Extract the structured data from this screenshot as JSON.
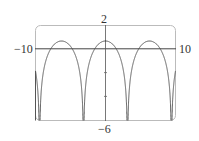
{
  "chart_data": {
    "type": "line",
    "title": "",
    "xlabel": "",
    "ylabel": "",
    "xlim": [
      -10,
      10
    ],
    "ylim": [
      -6,
      2
    ],
    "grid": false,
    "tick_labels": {
      "x_min": "−10",
      "x_max": "10",
      "y_max": "2",
      "y_min": "−6"
    },
    "series": [
      {
        "name": "y = ln(1 + cos x)",
        "description": "periodic arches, period 2π, peak ≈0.69 at x = 0, ±2π; vertical asymptotes at x = ±π, ±3π",
        "x": [
          -10,
          -9.42,
          -8,
          -6.28,
          -4.5,
          -3.14,
          -2,
          0,
          2,
          3.14,
          4.5,
          6.28,
          8,
          9.42,
          10
        ],
        "values": [
          -1.85,
          -6,
          -1.53,
          0.69,
          -1.76,
          -6,
          -0.89,
          0.69,
          -0.89,
          -6,
          -1.76,
          0.69,
          -1.53,
          -6,
          -1.85
        ]
      }
    ]
  },
  "labels": {
    "x_min": "−10",
    "x_max": "10",
    "y_max": "2",
    "y_min": "−6"
  }
}
